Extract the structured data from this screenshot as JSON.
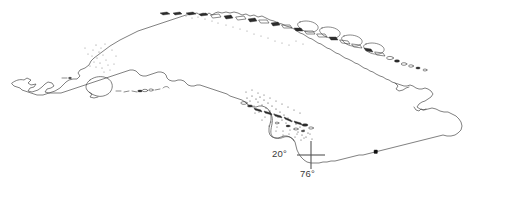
{
  "figure": {
    "background_color": "#ffffff",
    "coastline_color": "#4a4a4a",
    "stipple_color": "#7d7d7d",
    "marker_color": "#111111"
  },
  "graticule": {
    "latitude_label": "20°",
    "longitude_label": "76°",
    "crosshair": {
      "center_x": 311,
      "center_y": 155,
      "arm_length": 14
    }
  },
  "landmasses": [
    {
      "name": "cuba-main-island",
      "label": "Cuba"
    },
    {
      "name": "isla-de-la-juventud",
      "label": "Isla de la Juventud"
    }
  ],
  "archipelagos": [
    {
      "name": "archipielago-de-sabana-camaguey",
      "label": "Sabana-Camagüey (north keys)"
    },
    {
      "name": "archipielago-de-los-canarreos",
      "label": "Los Canarreos (southwest keys)"
    },
    {
      "name": "jardines-de-la-reina",
      "label": "Jardines de la Reina (south keys)"
    }
  ],
  "occurrence_markers": [
    {
      "name": "record-point-south-oriente",
      "x": 376,
      "y": 152
    }
  ],
  "stipple_regions": [
    {
      "name": "stipple-western-cuba",
      "density": "sparse"
    },
    {
      "name": "stipple-north-central-coast",
      "density": "sparse"
    },
    {
      "name": "stipple-gulf-of-ana-maria",
      "density": "dense"
    },
    {
      "name": "stipple-jardines-de-la-reina",
      "density": "dense"
    }
  ]
}
